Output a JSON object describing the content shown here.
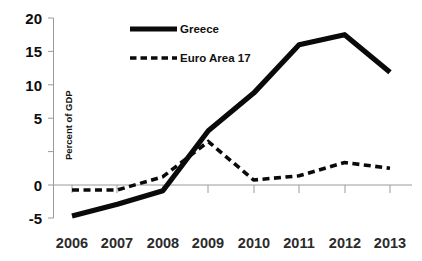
{
  "chart_data": {
    "type": "line",
    "title": "",
    "subtitle": "",
    "xlabel": "",
    "ylabel": "Percent of GDP",
    "categories": [
      "2006",
      "2007",
      "2008",
      "2009",
      "2010",
      "2011",
      "2012",
      "2013"
    ],
    "x": [
      2006,
      2007,
      2008,
      2009,
      2010,
      2011,
      2012,
      2013
    ],
    "xlim": [
      2006,
      2013
    ],
    "ylim": [
      -5,
      20
    ],
    "yticks": [
      -5,
      0,
      5,
      10,
      15,
      20
    ],
    "ytick_labels": [
      "-5",
      "0",
      "5",
      "10",
      "15",
      "20"
    ],
    "grid": false,
    "legend_position": "top-center",
    "series": [
      {
        "name": "Greece",
        "style": "solid",
        "color": "#0a0a0a",
        "values": [
          -3.7,
          -2.3,
          -0.7,
          6.5,
          11.0,
          16.8,
          18.0,
          13.5
        ]
      },
      {
        "name": "Euro Area 17",
        "style": "dashed",
        "color": "#0a0a0a",
        "values": [
          -0.6,
          -0.6,
          1.0,
          5.2,
          0.6,
          1.1,
          2.7,
          2.0
        ]
      }
    ]
  },
  "axes": {
    "y_title": "Percent of GDP",
    "y_tick_labels": [
      "20",
      "15",
      "10",
      "5",
      "0",
      "-5"
    ],
    "x_tick_labels": [
      "2006",
      "2007",
      "2008",
      "2009",
      "2010",
      "2011",
      "2012",
      "2013"
    ]
  },
  "legend": {
    "items": [
      {
        "label": "Greece",
        "style": "solid"
      },
      {
        "label": "Euro Area 17",
        "style": "dashed"
      }
    ]
  },
  "colors": {
    "series": "#0a0a0a",
    "axis": "#9a9a9a",
    "text": "#111111",
    "background": "#ffffff"
  }
}
